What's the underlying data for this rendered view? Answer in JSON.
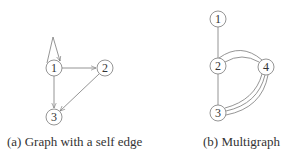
{
  "figure_a": {
    "caption": "(a) Graph with a self edge",
    "directed": true,
    "nodes": [
      {
        "id": "1",
        "label": "1",
        "x": 54,
        "y": 68
      },
      {
        "id": "2",
        "label": "2",
        "x": 105,
        "y": 68
      },
      {
        "id": "3",
        "label": "3",
        "x": 54,
        "y": 117
      }
    ],
    "edges": [
      {
        "from": "1",
        "to": "1",
        "type": "self-loop"
      },
      {
        "from": "1",
        "to": "2"
      },
      {
        "from": "1",
        "to": "3"
      },
      {
        "from": "2",
        "to": "3"
      }
    ]
  },
  "figure_b": {
    "caption": "(b) Multigraph",
    "directed": false,
    "nodes": [
      {
        "id": "1",
        "label": "1",
        "x": 218,
        "y": 19
      },
      {
        "id": "2",
        "label": "2",
        "x": 218,
        "y": 66
      },
      {
        "id": "4",
        "label": "4",
        "x": 266,
        "y": 67
      },
      {
        "id": "3",
        "label": "3",
        "x": 218,
        "y": 113
      }
    ],
    "edges": [
      {
        "from": "1",
        "to": "2",
        "multiplicity": 1
      },
      {
        "from": "2",
        "to": "3",
        "multiplicity": 1
      },
      {
        "from": "2",
        "to": "4",
        "multiplicity": 2
      },
      {
        "from": "4",
        "to": "3",
        "multiplicity": 3
      }
    ]
  },
  "colors": {
    "stroke": "#7a7a7a",
    "text": "#333333",
    "background": "#ffffff"
  }
}
